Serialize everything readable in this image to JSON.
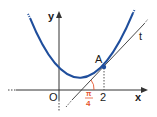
{
  "figure": {
    "axes": {
      "x_label": "x",
      "y_label": "y",
      "origin_label": "O"
    },
    "curve": {
      "color": "#1f4e9c",
      "description": "parabola"
    },
    "tangent": {
      "label": "t",
      "color": "#333333"
    },
    "point": {
      "label": "A",
      "x_tick": "2",
      "color": "#1f4e9c"
    },
    "angle": {
      "numerator": "π",
      "denominator": "4",
      "color": "#e5532d"
    }
  }
}
